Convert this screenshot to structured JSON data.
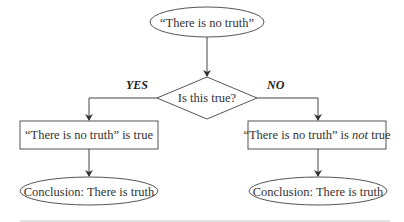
{
  "diagram": {
    "start": {
      "label": "“There is no truth”"
    },
    "decision": {
      "label": "Is this true?"
    },
    "branches": {
      "yes": {
        "edge_label": "YES",
        "statement": {
          "prefix": "“There is no truth” is true",
          "emphasis": "",
          "suffix": ""
        },
        "conclusion": "Conclusion: There is truth"
      },
      "no": {
        "edge_label": "NO",
        "statement": {
          "prefix": "“There is no truth” is ",
          "emphasis": "not",
          "suffix": " true"
        },
        "conclusion": "Conclusion: There is truth"
      }
    }
  },
  "colors": {
    "stroke": "#555555",
    "text": "#333333",
    "rule": "#d8d8d8"
  }
}
